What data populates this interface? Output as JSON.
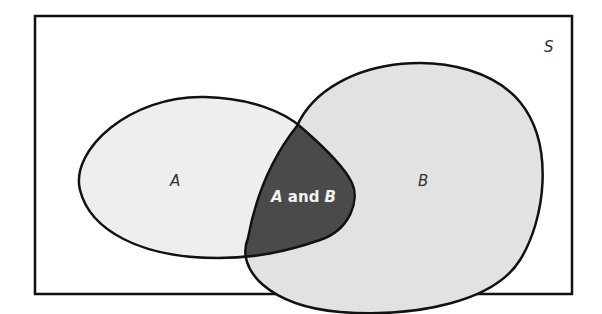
{
  "diagram": {
    "type": "venn",
    "universe_label": "S",
    "set_a_label": "A",
    "set_b_label": "B",
    "intersection_label_parts": [
      "A",
      " and ",
      "B"
    ],
    "colors": {
      "set_a_fill": "#eeeeee",
      "set_b_fill": "#e0e0e0",
      "intersection_fill": "#4a4a4a",
      "outline": "#111111",
      "intersection_text": "#f2f2f2"
    }
  }
}
